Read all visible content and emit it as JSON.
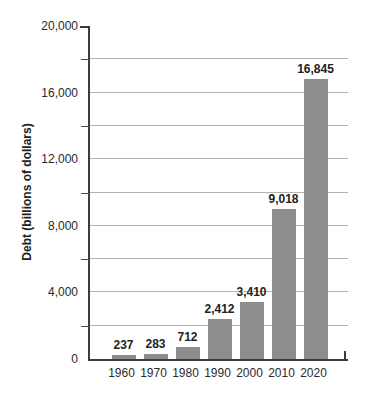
{
  "chart_data": {
    "type": "bar",
    "title": "",
    "xlabel": "",
    "ylabel": "Debt (billions of dollars)",
    "categories": [
      "1960",
      "1970",
      "1980",
      "1990",
      "2000",
      "2010",
      "2020"
    ],
    "values": [
      237,
      283,
      712,
      2412,
      3410,
      9018,
      16845
    ],
    "value_labels": [
      "237",
      "283",
      "712",
      "2,412",
      "3,410",
      "9,018",
      "16,845"
    ],
    "ylim": [
      0,
      20000
    ],
    "y_major_ticks": [
      0,
      4000,
      8000,
      12000,
      16000,
      20000
    ],
    "y_tick_labels": [
      "0",
      "4,000",
      "8,000",
      "12,000",
      "16,000",
      "20,000"
    ],
    "gridline_interval": 2000,
    "grid": "horizontal",
    "legend": "none",
    "bar_color": "#8d8d8d",
    "gridline_color": "#b2b2b2",
    "axis_color": "#3c3c3c",
    "text_color": "#2a2a2a"
  }
}
